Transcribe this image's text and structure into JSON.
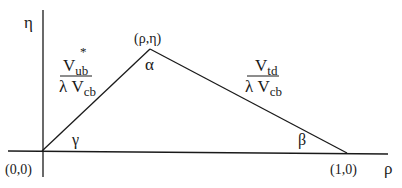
{
  "diagram": {
    "type": "unitarity-triangle",
    "axes": {
      "vertical_label": "η",
      "horizontal_label": "ρ"
    },
    "vertices": {
      "origin": "(0,0)",
      "apex": "(ρ,η)",
      "right": "(1,0)"
    },
    "angles": {
      "apex": "α",
      "right": "β",
      "origin": "γ"
    },
    "sides": {
      "left": {
        "numerator": "V",
        "numerator_sub": "ub",
        "numerator_sup": "*",
        "denominator_prefix": "λ V",
        "denominator_sub": "cb"
      },
      "right": {
        "numerator": "V",
        "numerator_sub": "td",
        "denominator_prefix": "λ V",
        "denominator_sub": "cb"
      }
    }
  }
}
